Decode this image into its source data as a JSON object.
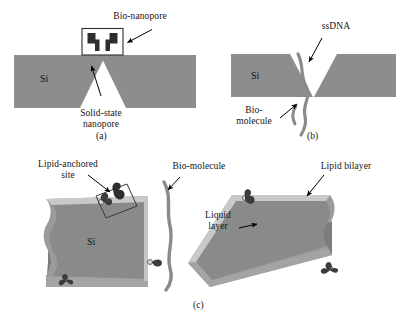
{
  "figure": {
    "caption_a": "(a)",
    "caption_b": "(b)",
    "caption_c": "(c)",
    "material_label": "Si",
    "colors": {
      "background": "#ffffff",
      "silicon": "#8d8d8d",
      "silicon_dark": "#7c7c7c",
      "lipid_bilayer": "#909090",
      "liquid_layer": "#c9c9c9",
      "molecule": "#4a4a4a",
      "nanopore_body": "#2e2e2e",
      "leader": "#000000",
      "text": "#141414"
    }
  },
  "panel_a": {
    "caption": "(a)",
    "material": "Si",
    "labels": [
      {
        "id": "bio-nanopore",
        "text": "Bio-nanopore"
      },
      {
        "id": "solid-state-nanopore",
        "text": "Solid-state\nnanopore"
      }
    ]
  },
  "panel_b": {
    "caption": "(b)",
    "material": "Si",
    "labels": [
      {
        "id": "ssdna",
        "text": "ssDNA"
      },
      {
        "id": "bio-molecule",
        "text": "Bio-\nmolecule"
      }
    ]
  },
  "panel_c": {
    "caption": "(c)",
    "material": "Si",
    "labels": [
      {
        "id": "lipid-anchored-site",
        "text": "Lipid-anchored\nsite"
      },
      {
        "id": "bio-molecule",
        "text": "Bio-molecule"
      },
      {
        "id": "lipid-bilayer",
        "text": "Lipid bilayer"
      },
      {
        "id": "liquid-layer",
        "text": "Liquid\nlayer"
      }
    ]
  }
}
